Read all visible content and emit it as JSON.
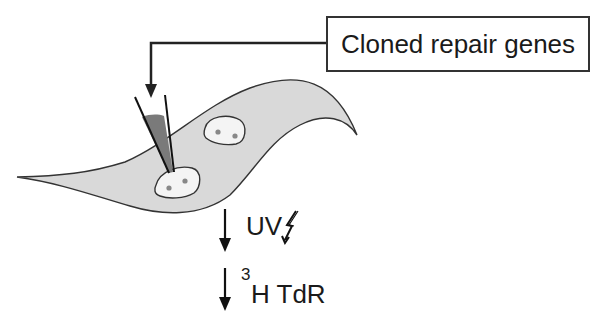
{
  "diagram": {
    "title_box": {
      "label": "Cloned repair genes"
    },
    "steps": [
      {
        "label": "UV",
        "icon": "lightning-bolt-icon"
      },
      {
        "superscript": "3",
        "label": "H TdR"
      }
    ],
    "elements": {
      "cell": {
        "shape": "spindle-shaped cell",
        "fill": "#d9d9d9",
        "stroke": "#333333"
      },
      "nuclei": [
        {
          "name": "injected-nucleus",
          "fill": "#f4f4f4",
          "dots": 2,
          "dot_color": "#888888"
        },
        {
          "name": "uninjected-nucleus",
          "fill": "#f4f4f4",
          "dots": 2,
          "dot_color": "#888888"
        }
      ],
      "micropipette": {
        "fluid_color": "#7a7a7a"
      },
      "connector": {
        "color": "#222222"
      }
    }
  }
}
